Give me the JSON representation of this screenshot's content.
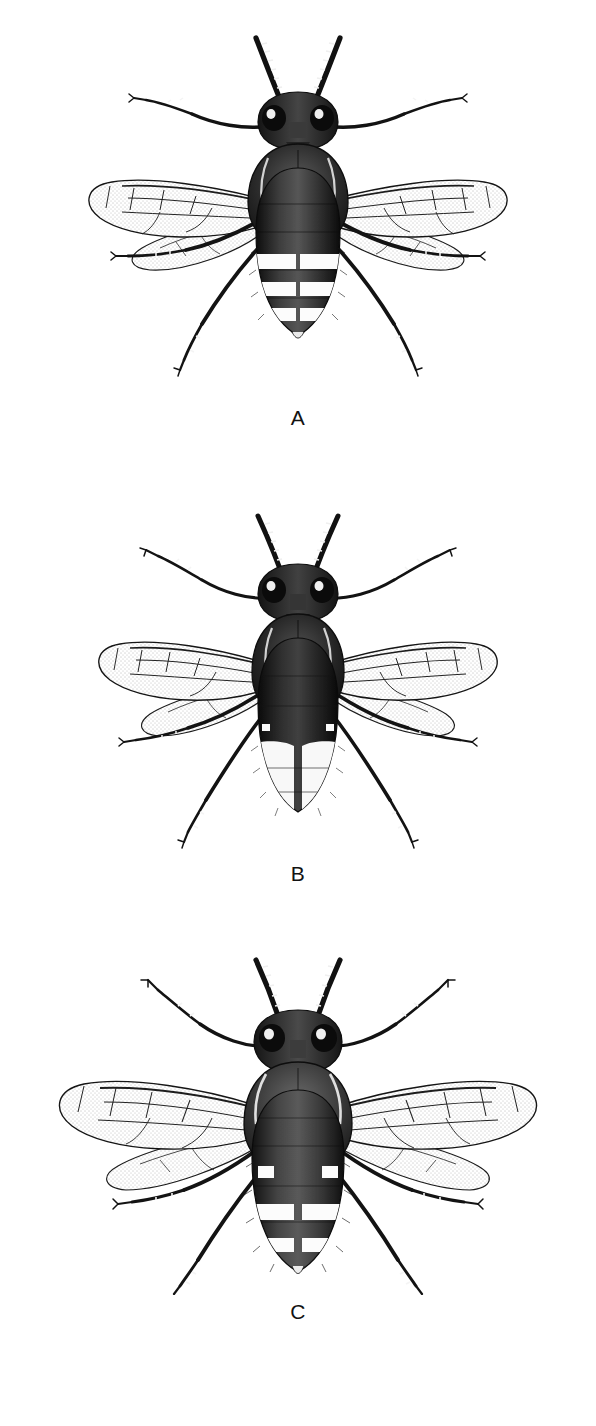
{
  "plate": {
    "background_color": "#ffffff",
    "ink_color": "#141414",
    "style": "stippled pen-and-ink scientific illustration",
    "orientation": "three vertically stacked dorsal-view specimens",
    "panel_count": 3
  },
  "panels": [
    {
      "label": "A",
      "subject": "wasp-dorsal-view",
      "description": "Dorsal view of a wasp with slender body, three white abdominal bands",
      "body_length_px": 330,
      "wingspan_px": 400,
      "abdomen": {
        "ground_color": "#171717",
        "band_color": "#fdfdfd",
        "band_count": 3,
        "band_note": "each pale band interrupted at the midline"
      },
      "thorax": {
        "shape": "oval",
        "pale_marks": 2
      },
      "head": {
        "eye_count": 2,
        "eye_color": "#101010",
        "eye_highlight": "#f2f2f2"
      },
      "antennae": {
        "count": 2,
        "segments_per_antenna": 11,
        "pattern": "alternating dark and pale annulations"
      },
      "legs": {
        "count": 6,
        "pattern": "banded, with terminal tarsal claws"
      },
      "wings": {
        "count": 4,
        "membrane": "hyaline with fine stipple",
        "venation": "dark veins enclosing closed cells"
      }
    },
    {
      "label": "B",
      "subject": "wasp-dorsal-view",
      "description": "Dorsal view of a wasp with a broad pale apex occupying the terminal abdominal segments",
      "body_length_px": 300,
      "wingspan_px": 390,
      "abdomen": {
        "ground_color": "#121212",
        "band_color": "#fbfbfb",
        "band_count": 1,
        "band_note": "single broad pale area covering the apical segments"
      },
      "thorax": {
        "shape": "oval",
        "pale_marks": 2
      },
      "head": {
        "eye_count": 2,
        "eye_color": "#101010",
        "eye_highlight": "#f2f2f2"
      },
      "antennae": {
        "count": 2,
        "segments_per_antenna": 11,
        "pattern": "alternating dark and pale annulations"
      },
      "legs": {
        "count": 6,
        "pattern": "banded, with terminal tarsal claws"
      },
      "wings": {
        "count": 4,
        "membrane": "hyaline with fine stipple",
        "venation": "dark veins enclosing closed cells"
      }
    },
    {
      "label": "C",
      "subject": "wasp-dorsal-view",
      "description": "Dorsal view of the largest wasp, with broad wings and paired white spots plus two pale bands",
      "body_length_px": 350,
      "wingspan_px": 470,
      "abdomen": {
        "ground_color": "#1a1a1a",
        "band_color": "#fdfdfd",
        "band_count": 2,
        "spot_pairs": 2,
        "band_note": "two interrupted pale bands toward the apex plus lateral spot pairs"
      },
      "thorax": {
        "shape": "broad rounded",
        "pale_marks": 2
      },
      "head": {
        "eye_count": 2,
        "eye_color": "#101010",
        "eye_highlight": "#f2f2f2"
      },
      "antennae": {
        "count": 2,
        "segments_per_antenna": 11,
        "pattern": "alternating dark and pale annulations"
      },
      "legs": {
        "count": 6,
        "pattern": "banded, with terminal tarsal claws"
      },
      "wings": {
        "count": 4,
        "membrane": "hyaline with fine stipple",
        "venation": "dark veins enclosing closed cells"
      }
    }
  ]
}
